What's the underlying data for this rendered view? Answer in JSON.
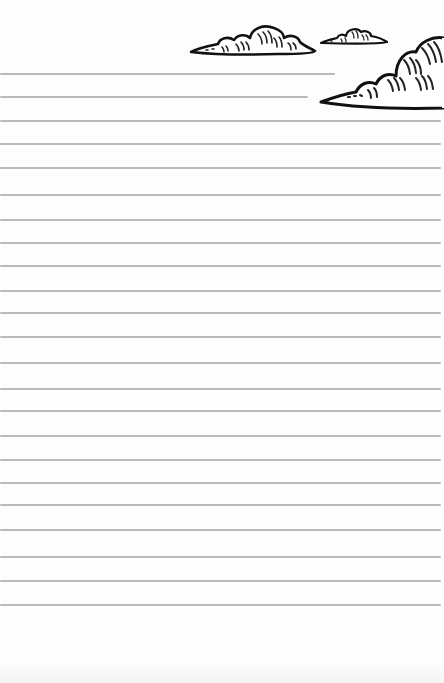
{
  "page": {
    "type": "lined-stationery",
    "background_color": "#fdfdfd",
    "line_color": "#b2b2b2",
    "lines": [
      {
        "y": 74,
        "x_end": 335
      },
      {
        "y": 97,
        "x_end": 308
      },
      {
        "y": 121,
        "x_end": 441
      },
      {
        "y": 144,
        "x_end": 441
      },
      {
        "y": 168,
        "x_end": 441
      },
      {
        "y": 195,
        "x_end": 441
      },
      {
        "y": 220,
        "x_end": 441
      },
      {
        "y": 243,
        "x_end": 441
      },
      {
        "y": 266,
        "x_end": 441
      },
      {
        "y": 291,
        "x_end": 441
      },
      {
        "y": 313,
        "x_end": 441
      },
      {
        "y": 337,
        "x_end": 441
      },
      {
        "y": 363,
        "x_end": 441
      },
      {
        "y": 389,
        "x_end": 441
      },
      {
        "y": 411,
        "x_end": 441
      },
      {
        "y": 436,
        "x_end": 441
      },
      {
        "y": 460,
        "x_end": 441
      },
      {
        "y": 483,
        "x_end": 441
      },
      {
        "y": 505,
        "x_end": 441
      },
      {
        "y": 530,
        "x_end": 441
      },
      {
        "y": 557,
        "x_end": 441
      },
      {
        "y": 581,
        "x_end": 441
      },
      {
        "y": 605,
        "x_end": 441
      }
    ]
  },
  "decorations": {
    "clouds": [
      {
        "name": "cloud-medium-icon",
        "x": 188,
        "y": 22,
        "w": 130,
        "h": 36
      },
      {
        "name": "cloud-small-icon",
        "x": 319,
        "y": 26,
        "w": 70,
        "h": 22
      },
      {
        "name": "cloud-large-icon",
        "x": 318,
        "y": 34,
        "w": 126,
        "h": 78
      }
    ]
  }
}
